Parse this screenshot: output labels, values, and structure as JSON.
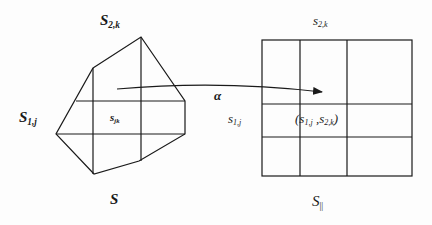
{
  "diagram": {
    "left_shape": {
      "name": "S",
      "label": "S",
      "top_label_main": "S",
      "top_label_sub": "2,k",
      "left_label_main": "S",
      "left_label_sub": "1,j",
      "cell_label_main": "s",
      "cell_label_sub": "jk",
      "polygon": [
        [
          93,
          68
        ],
        [
          141,
          37
        ],
        [
          185,
          101
        ],
        [
          185,
          134
        ],
        [
          139,
          161
        ],
        [
          94,
          174
        ],
        [
          56,
          134
        ]
      ],
      "h_lines": [
        [
          76,
          101,
          185,
          101
        ],
        [
          56,
          134,
          185,
          134
        ]
      ],
      "v_lines": [
        [
          93,
          68,
          93,
          174
        ],
        [
          141,
          37,
          141,
          161
        ]
      ]
    },
    "mapping": {
      "label": "α",
      "arrow_path": "M117,89 Q220,80 322,92"
    },
    "right_shape": {
      "name": "S||",
      "label_main": "S",
      "label_sub": "||",
      "top_label_main": "s",
      "top_label_sub": "2,k",
      "left_label_main": "s",
      "left_label_sub": "1,j",
      "cell_label_open": "(",
      "cell_label_a": "s",
      "cell_label_a_sub": "1,j",
      "cell_label_sep": " ,",
      "cell_label_b": "s",
      "cell_label_b_sub": "2,k",
      "cell_label_close": ")",
      "grid": {
        "x": 262,
        "y": 40,
        "width": 150,
        "height": 136
      },
      "v_lines": [
        300,
        347
      ],
      "h_lines": [
        104,
        137
      ]
    },
    "stroke_color": "#1a1a1a"
  }
}
